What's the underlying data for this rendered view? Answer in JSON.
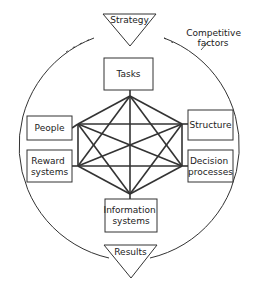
{
  "diagram": {
    "top_node": "Strategy",
    "bottom_node": "Results",
    "annotation": [
      "Competitive",
      "factors"
    ],
    "center_elements": [
      {
        "id": "tasks",
        "lines": [
          "Tasks"
        ]
      },
      {
        "id": "people",
        "lines": [
          "People"
        ]
      },
      {
        "id": "structure",
        "lines": [
          "Structure"
        ]
      },
      {
        "id": "reward-systems",
        "lines": [
          "Reward",
          "systems"
        ]
      },
      {
        "id": "decision-processes",
        "lines": [
          "Decision",
          "processes"
        ]
      },
      {
        "id": "information-systems",
        "lines": [
          "Information",
          "systems"
        ]
      }
    ]
  },
  "colors": {
    "line": "#333333",
    "background": "#ffffff"
  }
}
